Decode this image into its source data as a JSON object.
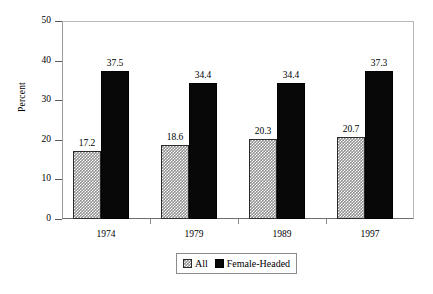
{
  "chart_data": {
    "type": "bar",
    "title": "",
    "subtitle": "",
    "xlabel": "",
    "ylabel": "Percent",
    "categories": [
      "1974",
      "1979",
      "1989",
      "1997"
    ],
    "series": [
      {
        "name": "All",
        "swatch": "hatched-gray-swatch",
        "color": "#8f8f8f",
        "values": [
          17.2,
          18.6,
          20.3,
          20.7
        ],
        "value_labels": [
          "17.2",
          "18.6",
          "20.3",
          "20.7"
        ]
      },
      {
        "name": "Female-Headed",
        "swatch": "solid-black-swatch",
        "color": "#080808",
        "values": [
          37.5,
          34.4,
          34.4,
          37.3
        ],
        "value_labels": [
          "37.5",
          "34.4",
          "34.4",
          "37.3"
        ]
      }
    ],
    "ylim": [
      0,
      50
    ],
    "ytick_values": [
      0,
      10,
      20,
      30,
      40,
      50
    ],
    "ytick_labels": [
      "0",
      "10",
      "20",
      "30",
      "40",
      "50"
    ],
    "grid": false,
    "legend_position": "bottom-center",
    "data_labels_shown": true
  }
}
